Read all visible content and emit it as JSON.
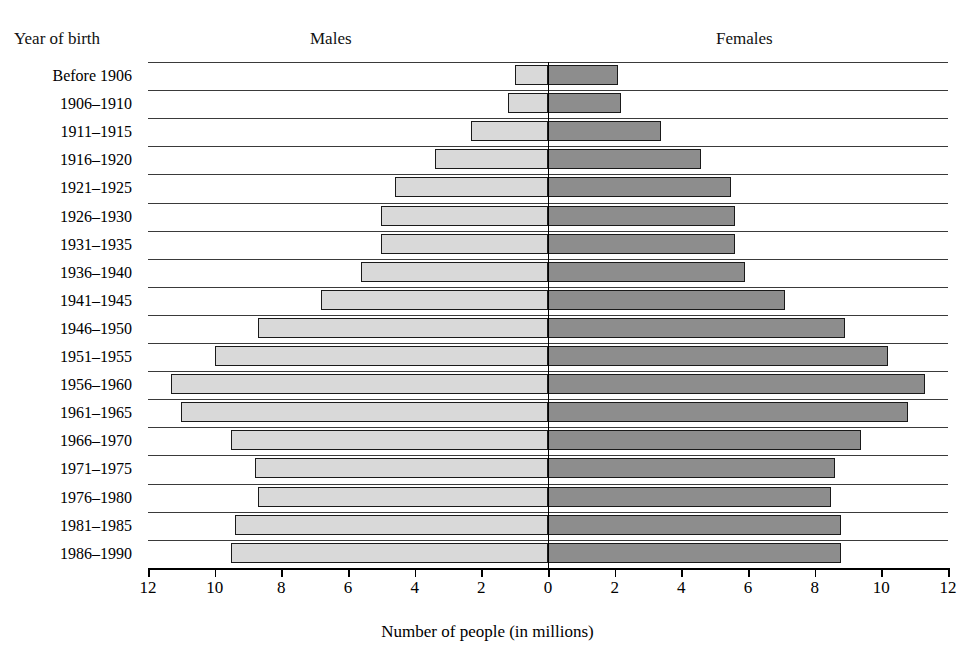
{
  "header": {
    "year_label": "Year of birth",
    "males_label": "Males",
    "females_label": "Females"
  },
  "axis": {
    "x_title": "Number of people (in millions)",
    "x_ticks": [
      "12",
      "10",
      "8",
      "6",
      "4",
      "2",
      "0",
      "2",
      "4",
      "6",
      "8",
      "10",
      "12"
    ]
  },
  "colors": {
    "male_bar": "#d9d9d9",
    "female_bar": "#8d8d8d",
    "bar_outline": "#1a1a1a",
    "gridline": "#3a3a3a",
    "axis": "#000000"
  },
  "chart_data": {
    "type": "bar",
    "subtype": "population-pyramid",
    "title": "",
    "xlabel": "Number of people (in millions)",
    "ylabel": "Year of birth",
    "xlim": [
      -12,
      12
    ],
    "x_tick_values": [
      -12,
      -10,
      -8,
      -6,
      -4,
      -2,
      0,
      2,
      4,
      6,
      8,
      10,
      12
    ],
    "x_tick_labels": [
      "12",
      "10",
      "8",
      "6",
      "4",
      "2",
      "0",
      "2",
      "4",
      "6",
      "8",
      "10",
      "12"
    ],
    "grid": true,
    "legend": [
      "Males",
      "Females"
    ],
    "legend_position": "top",
    "categories": [
      "Before 1906",
      "1906–1910",
      "1911–1915",
      "1916–1920",
      "1921–1925",
      "1926–1930",
      "1931–1935",
      "1936–1940",
      "1941–1945",
      "1946–1950",
      "1951–1955",
      "1956–1960",
      "1961–1965",
      "1966–1970",
      "1971–1975",
      "1976–1980",
      "1981–1985",
      "1986–1990"
    ],
    "series": [
      {
        "name": "Males",
        "values": [
          1.0,
          1.2,
          2.3,
          3.4,
          4.6,
          5.0,
          5.0,
          5.6,
          6.8,
          8.7,
          10.0,
          11.3,
          11.0,
          9.5,
          8.8,
          8.7,
          9.4,
          9.5
        ]
      },
      {
        "name": "Females",
        "values": [
          2.1,
          2.2,
          3.4,
          4.6,
          5.5,
          5.6,
          5.6,
          5.9,
          7.1,
          8.9,
          10.2,
          11.3,
          10.8,
          9.4,
          8.6,
          8.5,
          8.8,
          8.8
        ]
      }
    ]
  }
}
